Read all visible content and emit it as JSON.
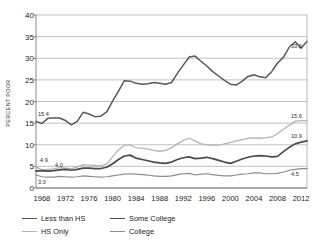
{
  "chart_data": {
    "type": "line",
    "title": "",
    "xlabel": "",
    "ylabel": "PERCENT POOR",
    "xlim": [
      1967,
      2013
    ],
    "ylim": [
      0,
      40
    ],
    "ytick_step": 5,
    "grid": true,
    "legend_position": "bottom-left",
    "yticks": [
      "0",
      "5",
      "10",
      "15",
      "20",
      "25",
      "30",
      "35",
      "40"
    ],
    "xticks": [
      "1968",
      "1972",
      "1976",
      "1980",
      "1984",
      "1988",
      "1992",
      "1996",
      "2000",
      "2004",
      "2008",
      "2012"
    ],
    "x": [
      1967,
      1968,
      1969,
      1970,
      1971,
      1972,
      1973,
      1974,
      1975,
      1976,
      1977,
      1978,
      1979,
      1980,
      1981,
      1982,
      1983,
      1984,
      1985,
      1986,
      1987,
      1988,
      1989,
      1990,
      1991,
      1992,
      1993,
      1994,
      1995,
      1996,
      1997,
      1998,
      1999,
      2000,
      2001,
      2002,
      2003,
      2004,
      2005,
      2006,
      2007,
      2008,
      2009,
      2010,
      2011,
      2012,
      2013
    ],
    "series": [
      {
        "name": "Less than HS",
        "color": "#58585a",
        "width": 1.5,
        "start_label": "15.4",
        "end_label": "33.9",
        "values": [
          15.4,
          14.9,
          16.1,
          16.2,
          16.2,
          15.6,
          14.6,
          15.4,
          17.5,
          17.1,
          16.5,
          16.6,
          17.6,
          20.1,
          22.4,
          24.8,
          24.7,
          24.2,
          24.0,
          24.1,
          24.4,
          24.2,
          24.0,
          24.4,
          26.5,
          28.4,
          30.3,
          30.5,
          29.3,
          28.2,
          26.9,
          25.9,
          24.9,
          24.0,
          23.8,
          24.7,
          25.8,
          26.2,
          25.7,
          25.5,
          26.9,
          28.9,
          30.2,
          32.6,
          33.8,
          32.3,
          33.9
        ]
      },
      {
        "name": "HS Only",
        "color": "#b4b4b4",
        "width": 1.3,
        "start_label": "4.9",
        "end_label": "15.6",
        "values": [
          4.9,
          4.2,
          4.3,
          4.4,
          4.7,
          4.6,
          4.5,
          4.8,
          5.4,
          5.3,
          5.2,
          5.1,
          5.5,
          7.2,
          8.8,
          9.9,
          9.9,
          9.3,
          9.2,
          9.0,
          8.7,
          8.5,
          8.7,
          9.3,
          10.2,
          11.0,
          11.5,
          10.9,
          10.2,
          10.0,
          9.9,
          9.9,
          10.2,
          10.5,
          10.9,
          11.2,
          11.5,
          11.6,
          11.5,
          11.6,
          11.8,
          12.6,
          13.6,
          14.5,
          15.4,
          15.6,
          15.6
        ]
      },
      {
        "name": "Some College",
        "color": "#4a4a4a",
        "width": 1.7,
        "start_label": "4.0",
        "end_label": "10.9",
        "values": [
          3.9,
          4.0,
          3.9,
          4.0,
          4.2,
          4.3,
          4.1,
          4.3,
          4.6,
          4.6,
          4.5,
          4.5,
          4.8,
          5.6,
          6.6,
          7.4,
          7.6,
          6.9,
          6.6,
          6.3,
          6.0,
          5.8,
          5.7,
          6.0,
          6.6,
          7.0,
          7.2,
          6.8,
          6.9,
          7.1,
          6.8,
          6.4,
          6.0,
          5.7,
          6.2,
          6.7,
          7.1,
          7.4,
          7.5,
          7.4,
          7.2,
          7.3,
          8.4,
          9.4,
          10.2,
          10.6,
          10.9
        ]
      },
      {
        "name": "College",
        "color": "#8d8d8d",
        "width": 1.2,
        "start_label": "3.0",
        "end_label": "4.5",
        "values": [
          3.0,
          2.6,
          2.5,
          2.5,
          2.7,
          2.6,
          2.5,
          2.6,
          2.8,
          2.7,
          2.6,
          2.5,
          2.6,
          2.8,
          3.0,
          3.2,
          3.3,
          3.2,
          3.1,
          3.0,
          2.8,
          2.7,
          2.7,
          2.8,
          3.1,
          3.3,
          3.4,
          3.0,
          3.2,
          3.3,
          3.1,
          2.9,
          2.8,
          2.8,
          3.0,
          3.2,
          3.3,
          3.5,
          3.5,
          3.3,
          3.3,
          3.4,
          3.7,
          4.1,
          4.3,
          4.5,
          4.5
        ]
      }
    ],
    "annotations": [
      {
        "text": "15.4",
        "series": "Less than HS",
        "position": "left"
      },
      {
        "text": "4.9",
        "series": "HS Only",
        "position": "left"
      },
      {
        "text": "4.0",
        "series": "Some College",
        "position": "left"
      },
      {
        "text": "3.0",
        "series": "College",
        "position": "left"
      },
      {
        "text": "33.9",
        "series": "Less than HS",
        "position": "right"
      },
      {
        "text": "15.6",
        "series": "HS Only",
        "position": "right"
      },
      {
        "text": "10.9",
        "series": "Some College",
        "position": "right"
      },
      {
        "text": "4.5",
        "series": "College",
        "position": "right"
      }
    ]
  },
  "legend": {
    "rows": [
      [
        {
          "label": "Less than HS",
          "color": "#58585a"
        },
        {
          "label": "Some College",
          "color": "#4a4a4a"
        }
      ],
      [
        {
          "label": "HS Only",
          "color": "#b4b4b4"
        },
        {
          "label": "College",
          "color": "#8d8d8d"
        }
      ]
    ]
  }
}
